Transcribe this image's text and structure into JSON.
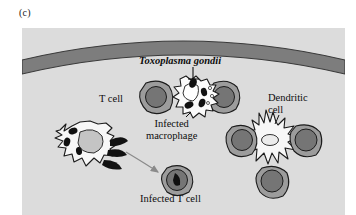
{
  "figure": {
    "panel_label": "(c)",
    "type": "biology-illustration"
  },
  "labels": {
    "t_cell": "T cell",
    "toxoplasma": "Toxoplasma gondii",
    "infected_macrophage": "Infected\nmacrophage",
    "dendritic_cell": "Dendritic\ncell",
    "infected_t_cell": "Infected T cell"
  },
  "colors": {
    "band": "#7d7d7d",
    "band_stroke": "#3a3a3a",
    "panel_background": "#dcdcdc",
    "cell_cytoplasm": "#9c9c9c",
    "cell_nucleus": "#757575",
    "macrophage_fill": "#f2f2f2",
    "macrophage_inner": "#bfbfbf",
    "parasite": "#111111",
    "outline": "#1c1c1c",
    "arrow": "#8a8a8a",
    "text": "#0d0d0d"
  },
  "elements": {
    "band_name": "tissue-boundary-band",
    "free_macrophage": "free-infected-macrophage-releasing-parasites",
    "infected_macrophage": "infected-macrophage-between-t-cells",
    "dendritic_cell": "dendritic-cell-with-three-t-cells",
    "infected_t_cell": "infected-t-cell-with-parasite",
    "arrow": "parasite-transfer-arrow"
  }
}
